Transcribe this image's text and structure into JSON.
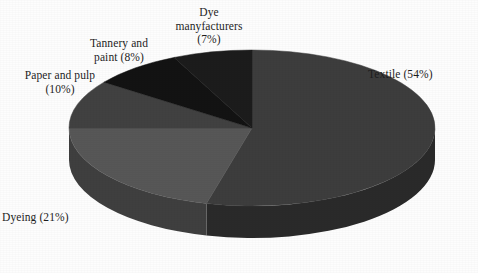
{
  "figure": {
    "background_color": "#fdfdfd",
    "text_color": "#1d1d1d"
  },
  "chart_data": {
    "type": "pie",
    "title": "",
    "subtitle": "",
    "xlabel": "",
    "ylabel": "",
    "grid": false,
    "legend_position": "none",
    "style": "3d-pie",
    "label_format": "{name} ({value}%)",
    "total": 100,
    "units": "percent",
    "start_angle_deg": 0,
    "direction": "clockwise",
    "categories": [
      "Textile",
      "Dyeing",
      "Paper and pulp",
      "Tannery and paint",
      "Dye manyfacturers"
    ],
    "values": [
      54,
      21,
      10,
      8,
      7
    ],
    "colors": [
      "#3d3d3d",
      "#575757",
      "#414141",
      "#131313",
      "#1c1c1c"
    ],
    "side_colors": [
      "#2a2a2a",
      "#3f3f3f",
      "#2f2f2f",
      "#0d0d0d",
      "#141414"
    ],
    "slices": [
      {
        "name": "Textile",
        "value": 54,
        "label": "Textile (54%)",
        "color": "#3d3d3d",
        "side_color": "#2a2a2a",
        "start_angle_deg": 0,
        "end_angle_deg": 194.4
      },
      {
        "name": "Dyeing",
        "value": 21,
        "label": "Dyeing (21%)",
        "color": "#575757",
        "side_color": "#3f3f3f",
        "start_angle_deg": 194.4,
        "end_angle_deg": 270
      },
      {
        "name": "Paper and pulp",
        "value": 10,
        "label": "Paper and pulp\n(10%)",
        "color": "#414141",
        "side_color": "#2f2f2f",
        "start_angle_deg": 270,
        "end_angle_deg": 306
      },
      {
        "name": "Tannery and paint",
        "value": 8,
        "label": "Tannery and\npaint (8%)",
        "color": "#131313",
        "side_color": "#0d0d0d",
        "start_angle_deg": 306,
        "end_angle_deg": 334.8
      },
      {
        "name": "Dye manyfacturers",
        "value": 7,
        "label": "Dye\nmanyfacturers\n(7%)",
        "color": "#1c1c1c",
        "side_color": "#141414",
        "start_angle_deg": 334.8,
        "end_angle_deg": 360
      }
    ]
  }
}
